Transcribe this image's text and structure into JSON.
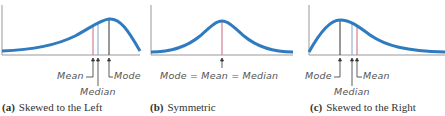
{
  "panels": [
    {
      "id": "a",
      "caption_letter": "(a)",
      "caption_text": "Skewed to the Left",
      "labels": {
        "mean": "Mean",
        "median": "Median",
        "mode": "Mode"
      }
    },
    {
      "id": "b",
      "caption_letter": "(b)",
      "caption_text": "Symmetric",
      "labels": {
        "combined": "Mode = Mean = Median"
      }
    },
    {
      "id": "c",
      "caption_letter": "(c)",
      "caption_text": "Skewed to the Right",
      "labels": {
        "mode": "Mode",
        "median": "Median",
        "mean": "Mean"
      }
    }
  ],
  "colors": {
    "curve": "#2f7bbf",
    "mean_line": "#c9667a",
    "median_line": "#7fa7cf",
    "mode_line": "#333333",
    "axis": "#888888"
  }
}
